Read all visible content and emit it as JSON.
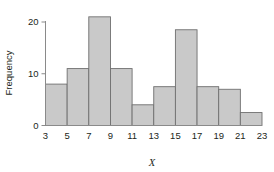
{
  "chart_data": {
    "type": "bar",
    "title": "",
    "subtitle": "",
    "xlabel": "X",
    "ylabel": "Frequency",
    "bin_edges": [
      3,
      5,
      7,
      9,
      11,
      13,
      15,
      17,
      19,
      21,
      23
    ],
    "categories": [
      "3-5",
      "5-7",
      "7-9",
      "9-11",
      "11-13",
      "13-15",
      "15-17",
      "17-19",
      "19-21",
      "21-23"
    ],
    "values": [
      8,
      11,
      21,
      11,
      4,
      7.5,
      18.5,
      7.5,
      7,
      2.5
    ],
    "xlim": [
      3,
      23
    ],
    "ylim": [
      0,
      21.5
    ],
    "xticks": [
      "3",
      "5",
      "7",
      "9",
      "11",
      "13",
      "15",
      "17",
      "19",
      "21",
      "23"
    ],
    "yticks": [
      "0",
      "10",
      "20"
    ],
    "ytick_values": [
      0,
      10,
      20
    ],
    "grid": false,
    "legend": null,
    "legend_position": "none",
    "bar_fill_color": "#c9c9c9",
    "bar_edge_color": "#6f6f6f",
    "axis_color": "#8a8a8a",
    "background_color": "#ffffff"
  }
}
